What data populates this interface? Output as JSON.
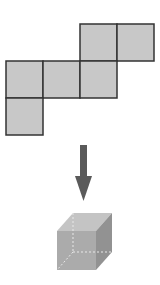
{
  "diagram": {
    "title": "",
    "net": {
      "fill": "#c8c8c8",
      "stroke": "#333333",
      "cell_size": 37,
      "cells": [
        {
          "col": 2,
          "row": 0
        },
        {
          "col": 3,
          "row": 0
        },
        {
          "col": 0,
          "row": 1
        },
        {
          "col": 1,
          "row": 1
        },
        {
          "col": 2,
          "row": 1
        },
        {
          "col": 0,
          "row": 2
        }
      ]
    },
    "arrow": {
      "direction": "down",
      "color": "#5a5a5a"
    },
    "cube": {
      "front_color": "#a8a8a8",
      "top_color": "#c4c4c4",
      "side_color": "#8e8e8e",
      "hidden_edge_color": "#e6e6e6"
    }
  }
}
